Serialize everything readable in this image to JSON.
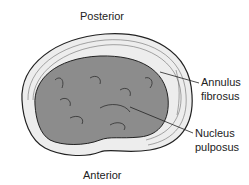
{
  "diagram": {
    "labels": {
      "posterior": "Posterior",
      "anterior": "Anterior",
      "annulus_line1": "Annulus",
      "annulus_line2": "fibrosus",
      "nucleus_line1": "Nucleus",
      "nucleus_line2": "pulposus"
    },
    "colors": {
      "annulus_fill": "#ededed",
      "nucleus_fill": "#8c8c8c",
      "stroke": "#222222"
    }
  }
}
